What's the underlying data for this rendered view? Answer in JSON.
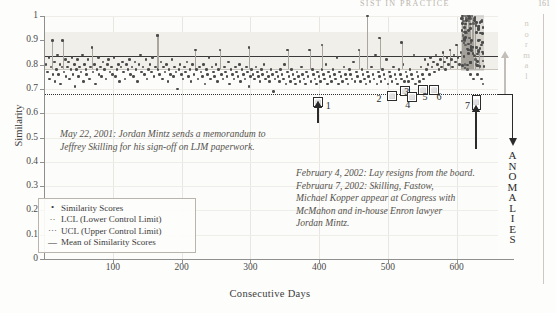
{
  "runhead": {
    "title": "SIST IN PRACTICE",
    "page": "161"
  },
  "chart_data": {
    "type": "scatter",
    "title": "",
    "xlabel": "Consecutive Days",
    "ylabel": "Similarity",
    "xlim": [
      0,
      660
    ],
    "ylim": [
      0,
      1
    ],
    "xticks": [
      100,
      200,
      300,
      400,
      500,
      600
    ],
    "yticks": [
      0,
      0.1,
      0.2,
      0.3,
      0.4,
      0.5,
      0.6,
      0.7,
      0.8,
      0.9,
      1
    ],
    "grid": true,
    "legend_position": "lower-left",
    "series": [
      {
        "name": "Similarity Scores",
        "marker": "dot",
        "color": "#4b4b4b"
      },
      {
        "name": "LCL (Lower Control Limit)",
        "style": "dotted",
        "value": 0.68,
        "color": "#2f2f2f"
      },
      {
        "name": "UCL (Upper Control Limit)",
        "style": "dotted",
        "value": 0.835,
        "color": "#3a3a3a"
      },
      {
        "name": "Mean of Similarity Scores",
        "style": "solid",
        "value": 0.78,
        "color": "#c9c5bd"
      }
    ],
    "ucl": 0.835,
    "lcl": 0.68,
    "mean": 0.78,
    "points": [
      [
        3,
        0.8
      ],
      [
        5,
        0.77
      ],
      [
        7,
        0.83
      ],
      [
        8,
        0.74
      ],
      [
        10,
        0.79
      ],
      [
        12,
        0.9
      ],
      [
        13,
        0.76
      ],
      [
        15,
        0.81
      ],
      [
        16,
        0.73
      ],
      [
        18,
        0.78
      ],
      [
        20,
        0.84
      ],
      [
        21,
        0.76
      ],
      [
        23,
        0.8
      ],
      [
        24,
        0.72
      ],
      [
        26,
        0.79
      ],
      [
        27,
        0.9
      ],
      [
        29,
        0.77
      ],
      [
        31,
        0.82
      ],
      [
        32,
        0.75
      ],
      [
        34,
        0.79
      ],
      [
        36,
        0.81
      ],
      [
        37,
        0.74
      ],
      [
        39,
        0.78
      ],
      [
        41,
        0.83
      ],
      [
        42,
        0.76
      ],
      [
        44,
        0.8
      ],
      [
        45,
        0.71
      ],
      [
        47,
        0.78
      ],
      [
        49,
        0.82
      ],
      [
        50,
        0.75
      ],
      [
        52,
        0.79
      ],
      [
        54,
        0.77
      ],
      [
        56,
        0.84
      ],
      [
        57,
        0.73
      ],
      [
        59,
        0.8
      ],
      [
        61,
        0.78
      ],
      [
        62,
        0.76
      ],
      [
        64,
        0.82
      ],
      [
        66,
        0.74
      ],
      [
        68,
        0.79
      ],
      [
        70,
        0.87
      ],
      [
        71,
        0.77
      ],
      [
        73,
        0.8
      ],
      [
        75,
        0.72
      ],
      [
        77,
        0.78
      ],
      [
        79,
        0.83
      ],
      [
        80,
        0.76
      ],
      [
        82,
        0.79
      ],
      [
        84,
        0.75
      ],
      [
        86,
        0.81
      ],
      [
        88,
        0.78
      ],
      [
        90,
        0.74
      ],
      [
        92,
        0.8
      ],
      [
        94,
        0.82
      ],
      [
        96,
        0.77
      ],
      [
        98,
        0.79
      ],
      [
        100,
        0.76
      ],
      [
        102,
        0.83
      ],
      [
        104,
        0.75
      ],
      [
        106,
        0.78
      ],
      [
        108,
        0.8
      ],
      [
        110,
        0.73
      ],
      [
        112,
        0.79
      ],
      [
        114,
        0.81
      ],
      [
        116,
        0.77
      ],
      [
        118,
        0.74
      ],
      [
        120,
        0.8
      ],
      [
        122,
        0.78
      ],
      [
        124,
        0.82
      ],
      [
        126,
        0.76
      ],
      [
        128,
        0.79
      ],
      [
        130,
        0.75
      ],
      [
        132,
        0.81
      ],
      [
        134,
        0.78
      ],
      [
        136,
        0.73
      ],
      [
        138,
        0.8
      ],
      [
        140,
        0.84
      ],
      [
        142,
        0.77
      ],
      [
        144,
        0.79
      ],
      [
        146,
        0.76
      ],
      [
        148,
        0.82
      ],
      [
        150,
        0.74
      ],
      [
        152,
        0.78
      ],
      [
        154,
        0.8
      ],
      [
        156,
        0.77
      ],
      [
        158,
        0.83
      ],
      [
        160,
        0.75
      ],
      [
        162,
        0.79
      ],
      [
        164,
        0.92
      ],
      [
        166,
        0.78
      ],
      [
        168,
        0.76
      ],
      [
        170,
        0.81
      ],
      [
        172,
        0.74
      ],
      [
        174,
        0.79
      ],
      [
        176,
        0.77
      ],
      [
        178,
        0.8
      ],
      [
        180,
        0.73
      ],
      [
        182,
        0.78
      ],
      [
        184,
        0.76
      ],
      [
        186,
        0.82
      ],
      [
        188,
        0.75
      ],
      [
        190,
        0.79
      ],
      [
        192,
        0.77
      ],
      [
        194,
        0.7
      ],
      [
        196,
        0.78
      ],
      [
        198,
        0.8
      ],
      [
        200,
        0.76
      ],
      [
        202,
        0.74
      ],
      [
        204,
        0.79
      ],
      [
        206,
        0.77
      ],
      [
        208,
        0.81
      ],
      [
        210,
        0.75
      ],
      [
        212,
        0.78
      ],
      [
        214,
        0.73
      ],
      [
        216,
        0.8
      ],
      [
        218,
        0.76
      ],
      [
        220,
        0.86
      ],
      [
        222,
        0.78
      ],
      [
        224,
        0.74
      ],
      [
        226,
        0.79
      ],
      [
        228,
        0.77
      ],
      [
        230,
        0.75
      ],
      [
        232,
        0.8
      ],
      [
        234,
        0.72
      ],
      [
        236,
        0.78
      ],
      [
        238,
        0.76
      ],
      [
        240,
        0.83
      ],
      [
        242,
        0.74
      ],
      [
        244,
        0.79
      ],
      [
        246,
        0.77
      ],
      [
        248,
        0.75
      ],
      [
        250,
        0.8
      ],
      [
        252,
        0.73
      ],
      [
        254,
        0.78
      ],
      [
        256,
        0.86
      ],
      [
        258,
        0.76
      ],
      [
        260,
        0.74
      ],
      [
        262,
        0.79
      ],
      [
        264,
        0.77
      ],
      [
        266,
        0.75
      ],
      [
        268,
        0.81
      ],
      [
        270,
        0.72
      ],
      [
        272,
        0.78
      ],
      [
        274,
        0.76
      ],
      [
        276,
        0.74
      ],
      [
        278,
        0.79
      ],
      [
        280,
        0.77
      ],
      [
        282,
        0.75
      ],
      [
        284,
        0.8
      ],
      [
        286,
        0.73
      ],
      [
        288,
        0.78
      ],
      [
        290,
        0.76
      ],
      [
        292,
        0.74
      ],
      [
        294,
        0.79
      ],
      [
        296,
        0.77
      ],
      [
        298,
        0.71
      ],
      [
        300,
        0.75
      ],
      [
        302,
        0.78
      ],
      [
        304,
        0.76
      ],
      [
        306,
        0.74
      ],
      [
        308,
        0.79
      ],
      [
        310,
        0.77
      ],
      [
        312,
        0.75
      ],
      [
        314,
        0.73
      ],
      [
        316,
        0.78
      ],
      [
        318,
        0.76
      ],
      [
        320,
        0.8
      ],
      [
        322,
        0.74
      ],
      [
        324,
        0.77
      ],
      [
        326,
        0.75
      ],
      [
        328,
        0.73
      ],
      [
        330,
        0.78
      ],
      [
        332,
        0.76
      ],
      [
        334,
        0.69
      ],
      [
        336,
        0.74
      ],
      [
        338,
        0.77
      ],
      [
        340,
        0.75
      ],
      [
        342,
        0.73
      ],
      [
        344,
        0.78
      ],
      [
        346,
        0.76
      ],
      [
        348,
        0.74
      ],
      [
        350,
        0.8
      ],
      [
        352,
        0.72
      ],
      [
        354,
        0.77
      ],
      [
        356,
        0.75
      ],
      [
        358,
        0.73
      ],
      [
        360,
        0.78
      ],
      [
        362,
        0.76
      ],
      [
        364,
        0.74
      ],
      [
        366,
        0.72
      ],
      [
        368,
        0.77
      ],
      [
        370,
        0.75
      ],
      [
        372,
        0.73
      ],
      [
        374,
        0.79
      ],
      [
        376,
        0.76
      ],
      [
        378,
        0.74
      ],
      [
        380,
        0.72
      ],
      [
        382,
        0.77
      ],
      [
        384,
        0.75
      ],
      [
        386,
        0.86
      ],
      [
        388,
        0.73
      ],
      [
        390,
        0.78
      ],
      [
        392,
        0.76
      ],
      [
        394,
        0.74
      ],
      [
        396,
        0.72
      ],
      [
        398,
        0.77
      ],
      [
        400,
        0.75
      ],
      [
        402,
        0.73
      ],
      [
        404,
        0.78
      ],
      [
        406,
        0.76
      ],
      [
        408,
        0.74
      ],
      [
        410,
        0.8
      ],
      [
        412,
        0.72
      ],
      [
        414,
        0.77
      ],
      [
        416,
        0.75
      ],
      [
        418,
        0.73
      ],
      [
        420,
        0.78
      ],
      [
        422,
        0.76
      ],
      [
        424,
        0.74
      ],
      [
        426,
        0.83
      ],
      [
        428,
        0.72
      ],
      [
        430,
        0.77
      ],
      [
        432,
        0.75
      ],
      [
        434,
        0.73
      ],
      [
        436,
        0.79
      ],
      [
        438,
        0.76
      ],
      [
        440,
        0.74
      ],
      [
        442,
        0.72
      ],
      [
        444,
        0.78
      ],
      [
        446,
        0.76
      ],
      [
        448,
        0.74
      ],
      [
        450,
        0.81
      ],
      [
        452,
        0.73
      ],
      [
        454,
        0.77
      ],
      [
        456,
        0.75
      ],
      [
        458,
        0.86
      ],
      [
        460,
        0.73
      ],
      [
        462,
        0.78
      ],
      [
        464,
        0.76
      ],
      [
        466,
        0.74
      ],
      [
        468,
        0.72
      ],
      [
        470,
        0.77
      ],
      [
        472,
        0.75
      ],
      [
        474,
        0.73
      ],
      [
        476,
        0.79
      ],
      [
        478,
        0.76
      ],
      [
        480,
        0.74
      ],
      [
        482,
        0.84
      ],
      [
        484,
        0.72
      ],
      [
        486,
        0.77
      ],
      [
        488,
        0.75
      ],
      [
        490,
        0.73
      ],
      [
        492,
        0.78
      ],
      [
        494,
        0.76
      ],
      [
        496,
        0.74
      ],
      [
        498,
        0.82
      ],
      [
        500,
        0.72
      ],
      [
        502,
        0.77
      ],
      [
        504,
        0.75
      ],
      [
        506,
        0.73
      ],
      [
        508,
        0.79
      ],
      [
        510,
        0.76
      ],
      [
        512,
        0.74
      ],
      [
        514,
        0.72
      ],
      [
        516,
        0.78
      ],
      [
        518,
        0.76
      ],
      [
        520,
        0.74
      ],
      [
        522,
        0.8
      ],
      [
        524,
        0.73
      ],
      [
        526,
        0.77
      ],
      [
        528,
        0.75
      ],
      [
        530,
        0.73
      ],
      [
        532,
        0.78
      ],
      [
        534,
        0.76
      ],
      [
        536,
        0.74
      ],
      [
        538,
        0.84
      ],
      [
        540,
        0.72
      ],
      [
        542,
        0.77
      ],
      [
        544,
        0.75
      ],
      [
        546,
        0.73
      ],
      [
        548,
        0.79
      ],
      [
        550,
        0.76
      ],
      [
        552,
        0.74
      ],
      [
        554,
        0.82
      ],
      [
        556,
        0.78
      ],
      [
        558,
        0.8
      ],
      [
        560,
        0.76
      ],
      [
        562,
        0.83
      ],
      [
        564,
        0.79
      ],
      [
        566,
        0.81
      ],
      [
        568,
        0.77
      ],
      [
        570,
        0.84
      ],
      [
        572,
        0.8
      ],
      [
        574,
        0.78
      ],
      [
        576,
        0.82
      ],
      [
        578,
        0.79
      ],
      [
        580,
        0.85
      ],
      [
        582,
        0.81
      ],
      [
        584,
        0.78
      ],
      [
        586,
        0.83
      ],
      [
        588,
        0.8
      ],
      [
        590,
        0.86
      ],
      [
        592,
        0.82
      ],
      [
        594,
        0.79
      ],
      [
        596,
        0.84
      ],
      [
        598,
        0.81
      ],
      [
        600,
        0.88
      ],
      [
        602,
        0.83
      ],
      [
        604,
        0.8
      ],
      [
        606,
        0.85
      ],
      [
        608,
        0.99
      ],
      [
        610,
        0.98
      ],
      [
        612,
        1.0
      ],
      [
        614,
        0.99
      ],
      [
        616,
        1.0
      ],
      [
        618,
        0.98
      ],
      [
        620,
        0.99
      ],
      [
        622,
        1.0
      ],
      [
        624,
        0.97
      ],
      [
        626,
        0.99
      ],
      [
        609,
        0.92
      ],
      [
        611,
        0.9
      ],
      [
        613,
        0.88
      ],
      [
        615,
        0.93
      ],
      [
        617,
        0.86
      ],
      [
        619,
        0.91
      ],
      [
        621,
        0.89
      ],
      [
        623,
        0.87
      ],
      [
        625,
        0.84
      ],
      [
        627,
        0.82
      ],
      [
        612,
        0.8
      ],
      [
        616,
        0.78
      ],
      [
        620,
        0.76
      ],
      [
        624,
        0.74
      ],
      [
        628,
        0.8
      ],
      [
        630,
        0.76
      ],
      [
        632,
        0.86
      ],
      [
        634,
        0.79
      ],
      [
        636,
        0.74
      ],
      [
        638,
        0.72
      ],
      [
        470,
        1.0
      ],
      [
        488,
        0.91
      ],
      [
        520,
        0.89
      ],
      [
        298,
        0.87
      ],
      [
        166,
        0.92
      ],
      [
        354,
        0.86
      ],
      [
        404,
        0.88
      ]
    ],
    "spikes": [
      [
        12,
        0.9
      ],
      [
        27,
        0.9
      ],
      [
        70,
        0.87
      ],
      [
        164,
        0.92
      ],
      [
        220,
        0.86
      ],
      [
        256,
        0.86
      ],
      [
        298,
        0.87
      ],
      [
        386,
        0.86
      ],
      [
        404,
        0.88
      ],
      [
        458,
        0.86
      ],
      [
        470,
        1.0
      ],
      [
        488,
        0.91
      ],
      [
        520,
        0.89
      ],
      [
        538,
        0.84
      ],
      [
        632,
        0.86
      ]
    ],
    "anomaly_region": {
      "start": 606,
      "end": 640,
      "label": "ANOMALIES"
    },
    "normal_label": "normal"
  },
  "annotations": {
    "first": "May 22, 2001: Jordan Mintz sends a memorandum to\nJeffrey Skilling for his sign-off on LJM paperwork.",
    "second": "February 4, 2002: Lay resigns from the board.\nFebruaru 7, 2002: Skilling, Fastow,\nMichael Kopper appear at Congress with\nMcMahon and in-house Enron lawyer\nJordan Mintz."
  },
  "legend": {
    "items": [
      {
        "key": "•",
        "label": "Similarity Scores"
      },
      {
        "key": "··",
        "label": "LCL (Lower Control Limit)"
      },
      {
        "key": "···",
        "label": "UCL (Upper Control Limit)"
      },
      {
        "key": "—",
        "label": "Mean of Similarity Scores"
      }
    ]
  },
  "events": [
    {
      "num": "1",
      "x_day": 398
    },
    {
      "num": "2",
      "x_day": 498
    },
    {
      "num": "3",
      "x_day": 518
    },
    {
      "num": "4",
      "x_day": 528
    },
    {
      "num": "5",
      "x_day": 546
    },
    {
      "num": "6",
      "x_day": 562
    },
    {
      "num": "7",
      "x_day": 628
    }
  ],
  "axes": {
    "yticks": [
      "1",
      "0.9",
      "0.8",
      "0.7",
      "0.6",
      "0.5",
      "0.4",
      "0.3",
      "0.2",
      "0.1",
      "0"
    ],
    "xticks": [
      "100",
      "200",
      "300",
      "400",
      "500",
      "600"
    ],
    "xlabel": "Consecutive Days",
    "ylabel": "Similarity"
  },
  "colors": {
    "point": "#4b4b4b",
    "ucl": "#3a3a3a",
    "lcl": "#2f2f2f",
    "mean": "#c9c5bd",
    "grid": "#e8e6e0",
    "band": "#f1efe9",
    "marker": "#2b2b2b"
  }
}
